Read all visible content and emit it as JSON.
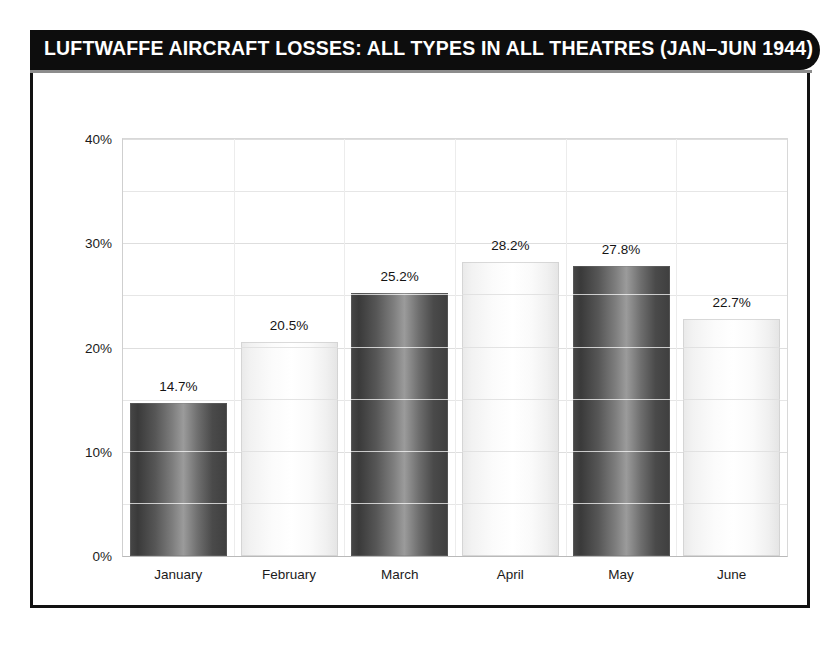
{
  "figure": {
    "title": "LUFTWAFFE AIRCRAFT LOSSES: ALL TYPES IN ALL THEATRES (JAN–JUN 1944)"
  },
  "chart_data": {
    "type": "bar",
    "title": "LUFTWAFFE AIRCRAFT LOSSES: ALL TYPES IN ALL THEATRES (JAN–JUN 1944)",
    "xlabel": "",
    "ylabel": "",
    "categories": [
      "January",
      "February",
      "March",
      "April",
      "May",
      "June"
    ],
    "values": [
      14.7,
      20.5,
      25.2,
      28.2,
      27.8,
      22.7
    ],
    "value_labels": [
      "14.7%",
      "20.5%",
      "25.2%",
      "28.2%",
      "27.8%",
      "22.7%"
    ],
    "ylim": [
      0,
      40
    ],
    "ytick_values": [
      0,
      10,
      20,
      30,
      40
    ],
    "ytick_labels": [
      "0%",
      "10%",
      "20%",
      "30%",
      "40%"
    ],
    "minor_tick_interval": 5,
    "grid": true,
    "legend": null,
    "bar_styles": [
      "dark",
      "light",
      "dark",
      "light",
      "dark",
      "light"
    ],
    "colors": {
      "bar_dark": "#4a4a4a",
      "bar_light": "#f5f5f5",
      "title_bar": "#0d0d0d",
      "title_text": "#ffffff",
      "frame": "#111111",
      "gridline": "#e6e6e6",
      "background": "#ffffff"
    }
  }
}
